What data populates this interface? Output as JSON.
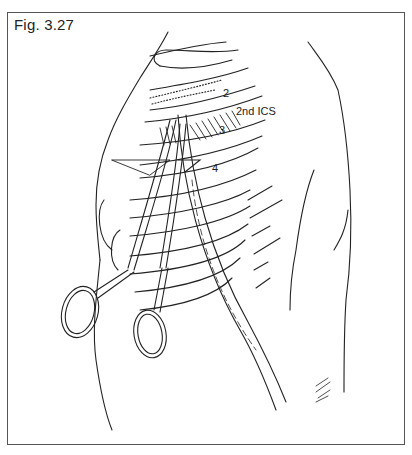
{
  "figure": {
    "label": "Fig. 3.27",
    "annotations": {
      "rib_2": "2",
      "space_2nd": "2nd ICS",
      "rib_3": "3",
      "rib_4": "4"
    },
    "content_description": "Line drawing of a patient's right lateral chest wall with the arm raised; a curved clamp (hemostat) inserted through the 2nd intercostal space between ribs 2 and 3, with a chest tube alongside",
    "colors": {
      "line": "#222222",
      "frame": "#555555",
      "background": "#ffffff"
    }
  }
}
